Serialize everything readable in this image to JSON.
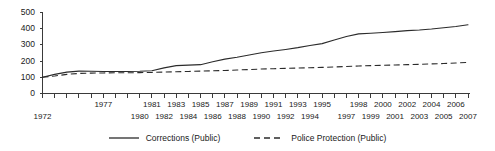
{
  "chart_data": {
    "type": "line",
    "title": "",
    "xlabel": "",
    "ylabel": "",
    "xlim": [
      1972,
      2007
    ],
    "ylim": [
      0,
      500
    ],
    "ytick_labels": [
      "500",
      "400",
      "300",
      "200",
      "100",
      "0"
    ],
    "ytick_values": [
      500,
      400,
      300,
      200,
      100,
      0
    ],
    "grid": false,
    "legend_position": "bottom-center",
    "x": [
      1972,
      1973,
      1974,
      1975,
      1976,
      1977,
      1978,
      1979,
      1980,
      1981,
      1982,
      1983,
      1984,
      1985,
      1986,
      1987,
      1988,
      1989,
      1990,
      1991,
      1992,
      1993,
      1994,
      1995,
      1996,
      1997,
      1998,
      1999,
      2000,
      2001,
      2002,
      2003,
      2004,
      2005,
      2006,
      2007
    ],
    "xtick_labels_upper": [
      "1977",
      "1981",
      "1983",
      "1985",
      "1987",
      "1989",
      "1991",
      "1993",
      "1995",
      "1998",
      "2000",
      "2002",
      "2004",
      "2006"
    ],
    "xtick_labels_lower": [
      "1972",
      "1980",
      "1982",
      "1984",
      "1986",
      "1988",
      "1990",
      "1992",
      "1994",
      "1997",
      "1999",
      "2001",
      "2003",
      "2005",
      "2007"
    ],
    "series": [
      {
        "name": "Corrections (Public)",
        "style": "solid",
        "color": "#2b2b2b",
        "values": [
          100,
          118,
          132,
          138,
          137,
          136,
          136,
          136,
          137,
          140,
          158,
          172,
          175,
          178,
          196,
          212,
          224,
          238,
          252,
          262,
          272,
          283,
          296,
          308,
          330,
          352,
          368,
          372,
          377,
          382,
          388,
          392,
          398,
          406,
          414,
          424
        ]
      },
      {
        "name": "Police Protection (Public)",
        "style": "dashed",
        "color": "#2b2b2b",
        "values": [
          100,
          108,
          118,
          124,
          126,
          127,
          128,
          128,
          129,
          130,
          132,
          134,
          136,
          138,
          140,
          142,
          145,
          148,
          151,
          153,
          155,
          157,
          159,
          161,
          164,
          167,
          170,
          172,
          174,
          176,
          178,
          180,
          183,
          185,
          188,
          192
        ]
      }
    ]
  },
  "legend": {
    "entries": [
      {
        "label": "Corrections (Public)",
        "icon": "solid-line-swatch"
      },
      {
        "label": "Police Protection (Public)",
        "icon": "dashed-line-swatch"
      }
    ]
  }
}
